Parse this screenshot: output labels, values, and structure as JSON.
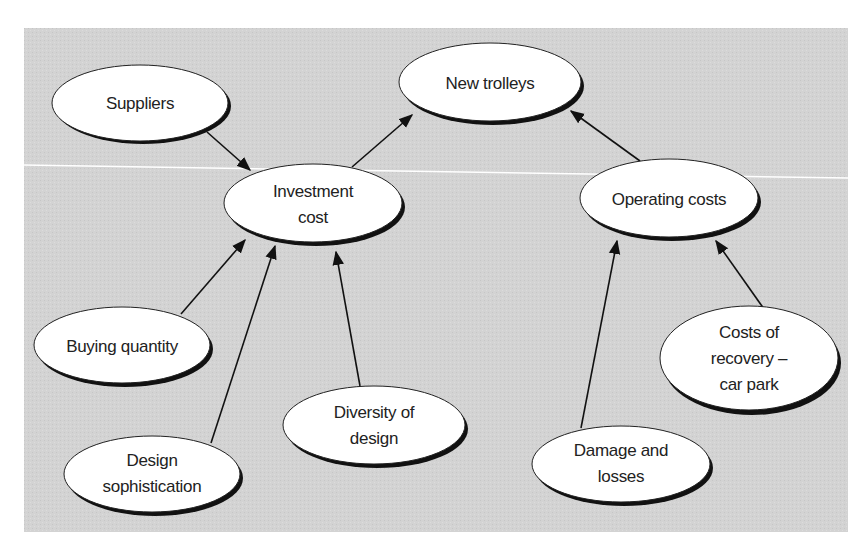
{
  "diagram": {
    "type": "influence-diagram",
    "background_color": "#d4d4d4",
    "nodes": [
      {
        "id": "suppliers",
        "lines": [
          "Suppliers"
        ]
      },
      {
        "id": "new_trolleys",
        "lines": [
          "New trolleys"
        ]
      },
      {
        "id": "investment_cost",
        "lines": [
          "Investment",
          "cost"
        ]
      },
      {
        "id": "operating_costs",
        "lines": [
          "Operating costs"
        ]
      },
      {
        "id": "buying_quantity",
        "lines": [
          "Buying quantity"
        ]
      },
      {
        "id": "design_sophistication",
        "lines": [
          "Design",
          "sophistication"
        ]
      },
      {
        "id": "diversity_of_design",
        "lines": [
          "Diversity of",
          "design"
        ]
      },
      {
        "id": "damage_and_losses",
        "lines": [
          "Damage and",
          "losses"
        ]
      },
      {
        "id": "costs_of_recovery",
        "lines": [
          "Costs of",
          "recovery –",
          "car park"
        ]
      }
    ],
    "edges": [
      {
        "from": "suppliers",
        "to": "investment_cost"
      },
      {
        "from": "investment_cost",
        "to": "new_trolleys"
      },
      {
        "from": "operating_costs",
        "to": "new_trolleys"
      },
      {
        "from": "buying_quantity",
        "to": "investment_cost"
      },
      {
        "from": "design_sophistication",
        "to": "investment_cost"
      },
      {
        "from": "diversity_of_design",
        "to": "investment_cost"
      },
      {
        "from": "damage_and_losses",
        "to": "operating_costs"
      },
      {
        "from": "costs_of_recovery",
        "to": "operating_costs"
      }
    ]
  }
}
